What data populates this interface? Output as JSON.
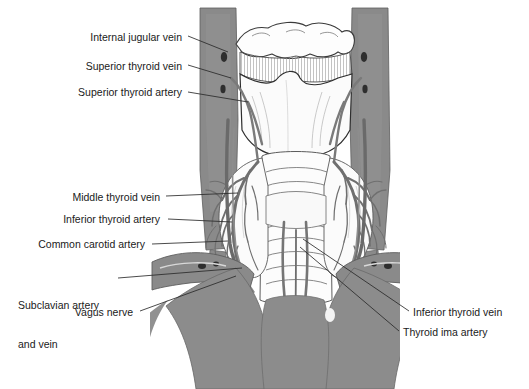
{
  "figure": {
    "background_color": "#ffffff",
    "colors": {
      "tissue_gray": "#8c8c8c",
      "muscle_gray": "#7e7e7e",
      "vessel_gray": "#7a7a7a",
      "outline": "#3a3a3a",
      "leader_line": "#2b2b2b",
      "label_text": "#1a1a1a",
      "light_fill": "#fdfdfd",
      "hatch": "#9a9a9a"
    }
  },
  "labels": [
    {
      "id": "internal-jugular-vein",
      "text": "Internal jugular vein",
      "side": "left",
      "text_anchor_x": 182,
      "text_anchor_y": 39,
      "leader": {
        "x1": 188,
        "y1": 36,
        "x2": 228,
        "y2": 52
      }
    },
    {
      "id": "superior-thyroid-vein",
      "text": "Superior thyroid vein",
      "side": "left",
      "text_anchor_x": 182,
      "text_anchor_y": 68,
      "leader": {
        "x1": 188,
        "y1": 65,
        "x2": 231,
        "y2": 78
      }
    },
    {
      "id": "superior-thyroid-artery",
      "text": "Superior thyroid artery",
      "side": "left",
      "text_anchor_x": 182,
      "text_anchor_y": 94,
      "leader": {
        "x1": 188,
        "y1": 92,
        "x2": 248,
        "y2": 102
      }
    },
    {
      "id": "middle-thyroid-vein",
      "text": "Middle thyroid vein",
      "side": "left",
      "text_anchor_x": 160,
      "text_anchor_y": 199,
      "leader": {
        "x1": 166,
        "y1": 196,
        "x2": 238,
        "y2": 193
      }
    },
    {
      "id": "inferior-thyroid-artery",
      "text": "Inferior thyroid artery",
      "side": "left",
      "text_anchor_x": 160,
      "text_anchor_y": 221,
      "leader": {
        "x1": 168,
        "y1": 219,
        "x2": 232,
        "y2": 222
      }
    },
    {
      "id": "common-carotid-artery",
      "text": "Common carotid artery",
      "side": "left",
      "text_anchor_x": 145,
      "text_anchor_y": 246,
      "leader": {
        "x1": 152,
        "y1": 244,
        "x2": 228,
        "y2": 241
      }
    },
    {
      "id": "subclavian-artery-and-vein",
      "text": "Subclavian artery\nand vein",
      "line1": "Subclavian artery",
      "line2": "and vein",
      "side": "left",
      "text_anchor_x": 110,
      "text_anchor_y": 281,
      "leader": {
        "x1": 118,
        "y1": 278,
        "x2": 242,
        "y2": 268
      }
    },
    {
      "id": "vagus-nerve",
      "text": "Vagus nerve",
      "side": "left",
      "text_anchor_x": 133,
      "text_anchor_y": 314,
      "leader": {
        "x1": 140,
        "y1": 311,
        "x2": 236,
        "y2": 276
      }
    },
    {
      "id": "inferior-thyroid-vein",
      "text": "Inferior thyroid vein",
      "side": "right",
      "text_anchor_x": 413,
      "text_anchor_y": 314,
      "leader": {
        "x1": 409,
        "y1": 311,
        "x2": 303,
        "y2": 239
      }
    },
    {
      "id": "thyroid-ima-artery",
      "text": "Thyroid ima artery",
      "side": "right",
      "text_anchor_x": 403,
      "text_anchor_y": 334,
      "leader": {
        "x1": 399,
        "y1": 331,
        "x2": 300,
        "y2": 247
      }
    }
  ]
}
